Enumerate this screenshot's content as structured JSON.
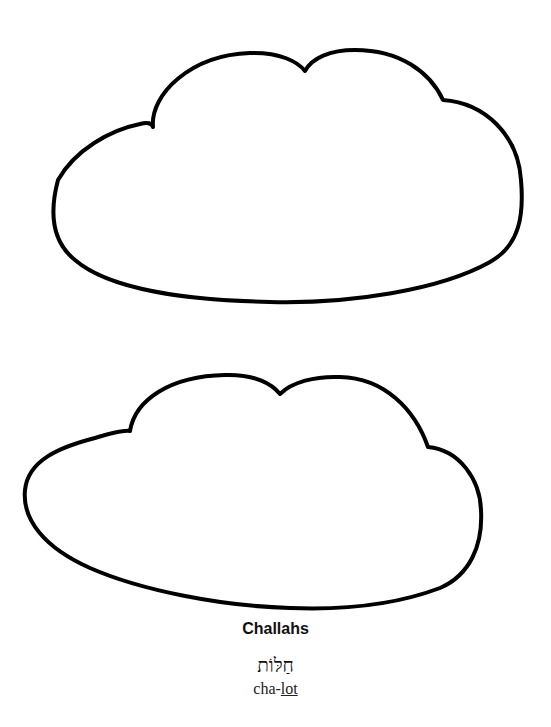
{
  "caption": {
    "title": "Challahs",
    "hebrew": "חַלּוֹת",
    "transliteration_prefix": "cha-",
    "transliteration_stressed": "lot"
  },
  "shapes": [
    {
      "name": "challah-outline-top"
    },
    {
      "name": "challah-outline-bottom"
    }
  ],
  "colors": {
    "stroke": "#000000",
    "background": "#ffffff"
  }
}
